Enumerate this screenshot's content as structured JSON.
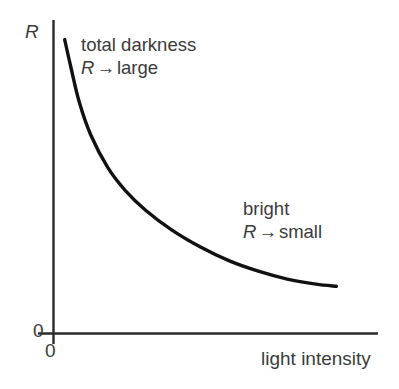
{
  "chart_data": {
    "type": "line",
    "title": "",
    "xlabel": "light intensity",
    "ylabel": "R",
    "x_origin_label": "0",
    "y_origin_label": "0",
    "grid": false,
    "legend": false,
    "axis_ticks": false,
    "xlim": [
      0,
      1
    ],
    "ylim": [
      0,
      1
    ],
    "series": [
      {
        "name": "resistance",
        "comment": "LDR resistance decreasing hyperbolically with light intensity",
        "x": [
          0.03,
          0.05,
          0.08,
          0.12,
          0.18,
          0.24,
          0.31,
          0.4,
          0.5,
          0.6,
          0.7,
          0.8,
          0.9,
          0.97
        ],
        "y": [
          0.965,
          0.88,
          0.76,
          0.65,
          0.54,
          0.465,
          0.4,
          0.335,
          0.278,
          0.232,
          0.198,
          0.172,
          0.155,
          0.148
        ]
      }
    ],
    "annotations": [
      {
        "name": "total-darkness",
        "line1": "total darkness",
        "symbol": "R",
        "arrow": "→",
        "line2_value": "large"
      },
      {
        "name": "bright",
        "line1": "bright",
        "symbol": "R",
        "arrow": "→",
        "line2_value": "small"
      }
    ],
    "colors": {
      "curve": "#111111",
      "axis": "#2a2a2a",
      "text": "#3b3b3b",
      "background": "#ffffff"
    }
  },
  "axes": {
    "y_label": "R",
    "x_label": "light intensity",
    "origin_left": "0",
    "origin_bottom": "0"
  },
  "annotations": {
    "dark": {
      "line1": "total darkness",
      "symbol": "R",
      "arrow": "→",
      "value": "large"
    },
    "bright": {
      "line1": "bright",
      "symbol": "R",
      "arrow": "→",
      "value": "small"
    }
  }
}
